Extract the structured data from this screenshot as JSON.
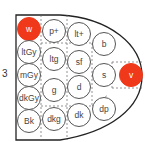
{
  "diagram": {
    "side_label": "3",
    "highlight_color": "#f0381a",
    "tones": [
      {
        "id": "w",
        "label": "w",
        "x": 29,
        "y": 29,
        "highlight": true
      },
      {
        "id": "ltGy",
        "label": "ltGy",
        "x": 29,
        "y": 52,
        "highlight": false
      },
      {
        "id": "mGy",
        "label": "mGy",
        "x": 29,
        "y": 75,
        "highlight": false
      },
      {
        "id": "dkGy",
        "label": "dkGy",
        "x": 29,
        "y": 98,
        "highlight": false
      },
      {
        "id": "Bk",
        "label": "Bk",
        "x": 29,
        "y": 121,
        "highlight": false
      },
      {
        "id": "p+",
        "label": "p+",
        "x": 54,
        "y": 31,
        "highlight": false
      },
      {
        "id": "ltg",
        "label": "ltg",
        "x": 54,
        "y": 59,
        "highlight": false
      },
      {
        "id": "g",
        "label": "g",
        "x": 54,
        "y": 90,
        "highlight": false
      },
      {
        "id": "dkg",
        "label": "dkg",
        "x": 54,
        "y": 119,
        "highlight": false
      },
      {
        "id": "lt+",
        "label": "lt+",
        "x": 79,
        "y": 34,
        "highlight": false
      },
      {
        "id": "sf",
        "label": "sf",
        "x": 79,
        "y": 62,
        "highlight": false
      },
      {
        "id": "d",
        "label": "d",
        "x": 79,
        "y": 87,
        "highlight": false
      },
      {
        "id": "dk",
        "label": "dk",
        "x": 79,
        "y": 115,
        "highlight": false
      },
      {
        "id": "b",
        "label": "b",
        "x": 104,
        "y": 44,
        "highlight": false
      },
      {
        "id": "s",
        "label": "s",
        "x": 104,
        "y": 75,
        "highlight": false
      },
      {
        "id": "dp",
        "label": "dp",
        "x": 104,
        "y": 109,
        "highlight": false
      },
      {
        "id": "v",
        "label": "v",
        "x": 131,
        "y": 75,
        "highlight": true
      }
    ]
  }
}
